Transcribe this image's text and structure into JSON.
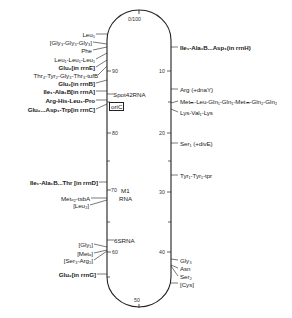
{
  "diagram": {
    "title_top": "0/100",
    "bottom_marker": "50",
    "ticks_left": [
      {
        "label": "90",
        "y": 71
      },
      {
        "label": "80",
        "y": 133
      },
      {
        "label": "70",
        "y": 190
      },
      {
        "label": "60",
        "y": 252
      }
    ],
    "ticks_right": [
      {
        "label": "10",
        "y": 71
      },
      {
        "label": "20",
        "y": 133
      },
      {
        "label": "30",
        "y": 192
      },
      {
        "label": "40",
        "y": 252
      }
    ],
    "inner_labels": {
      "spot42": "Spot42RNA",
      "oric": "oriC",
      "m1_line1": "M1",
      "m1_line2": "RNA",
      "rna65": "6SRNA"
    },
    "left_labels": [
      {
        "text": "Leu₅",
        "y": 31
      },
      {
        "text": "[Gly₃-Gly₃-Gly₃]",
        "y": 39
      },
      {
        "text": "Phe",
        "y": 47
      },
      {
        "text": "Leu₁-Leu₁-Leu₁",
        "y": 56
      },
      {
        "text": "Glu₂[in rrnE]",
        "y": 64
      },
      {
        "text": "Thr₄-Tyr₂-Gly₃-Thr₃-tufB",
        "y": 72
      },
      {
        "text": "Glu₂[in rrnB]",
        "y": 80
      },
      {
        "text": "Ile₁-Ala₁B[in rrnA]",
        "y": 88
      },
      {
        "text": "Arg-His-Leu₁-Pro",
        "y": 97
      },
      {
        "text": "Glu₂...Asp₁-Trp[in rrnC]",
        "y": 106
      },
      {
        "text": "Ile₁-Ala₁B...Thr [in rrnD]",
        "y": 179
      },
      {
        "text": "Metₒ₂-tsbA",
        "y": 195
      },
      {
        "text": "[Leu₂]",
        "y": 202
      },
      {
        "text": "[Gly₁]",
        "y": 241
      },
      {
        "text": "[Metₒ]",
        "y": 250
      },
      {
        "text": "[Ser₃-Arg₂]",
        "y": 257
      },
      {
        "text": "Glu₂[in rrnG]",
        "y": 271
      }
    ],
    "right_labels": [
      {
        "text": "Ile₁-Ala₁B...Asp₁(in rrnH)",
        "y": 44
      },
      {
        "text": "Arg (+dnaY)",
        "y": 86
      },
      {
        "text": "Metₘ-Leu-Gln₁-Gln₁-Metₘ-Gln₂-Gln₂",
        "y": 100
      },
      {
        "text": "Lys-Val₁-Lys",
        "y": 110
      },
      {
        "text": "Ser₁ (+divE)",
        "y": 140
      },
      {
        "text": "Tyr₁-Tyr₁-tpr",
        "y": 173
      },
      {
        "text": "Gly₃",
        "y": 257
      },
      {
        "text": "Asn",
        "y": 265
      },
      {
        "text": "Ser₂",
        "y": 273
      },
      {
        "text": "[Cys]",
        "y": 281
      }
    ]
  }
}
